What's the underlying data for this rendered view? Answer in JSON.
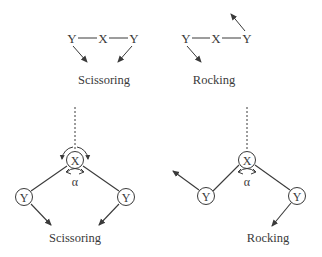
{
  "top_left": {
    "atoms": [
      "Y",
      "X",
      "Y"
    ],
    "caption": "Scissoring"
  },
  "top_right": {
    "atoms": [
      "Y",
      "X",
      "Y"
    ],
    "caption": "Rocking"
  },
  "bottom_left": {
    "center_atom": "X",
    "left_atom": "Y",
    "right_atom": "Y",
    "angle_label": "α",
    "caption": "Scissoring"
  },
  "bottom_right": {
    "center_atom": "X",
    "left_atom": "Y",
    "right_atom": "Y",
    "angle_label": "α",
    "caption": "Rocking"
  },
  "colors": {
    "line": "#3a3a3a",
    "background": "#ffffff"
  }
}
